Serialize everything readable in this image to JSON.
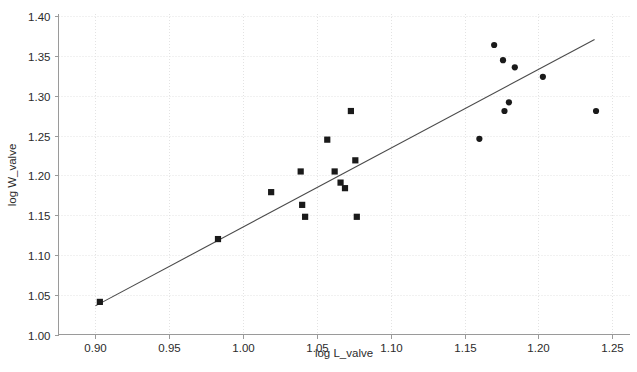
{
  "chart_data": {
    "type": "scatter",
    "title": "",
    "xlabel": "log L_valve",
    "ylabel": "log W_valve",
    "xlim": [
      0.875,
      1.262
    ],
    "ylim": [
      1.0,
      1.403
    ],
    "grid": true,
    "legend": "none",
    "xticks": [
      "0.90",
      "0.95",
      "1.00",
      "1.05",
      "1.10",
      "1.15",
      "1.20",
      "1.25"
    ],
    "xtick_values": [
      0.9,
      0.95,
      1.0,
      1.05,
      1.1,
      1.15,
      1.2,
      1.25
    ],
    "yticks": [
      "1.00",
      "1.05",
      "1.10",
      "1.15",
      "1.20",
      "1.25",
      "1.30",
      "1.35",
      "1.40"
    ],
    "ytick_values": [
      1.0,
      1.05,
      1.1,
      1.15,
      1.2,
      1.25,
      1.3,
      1.35,
      1.4
    ],
    "series": [
      {
        "name": "group-square",
        "marker": "square",
        "color": "#1a1a1a",
        "points": [
          {
            "x": 0.903,
            "y": 1.041
          },
          {
            "x": 0.983,
            "y": 1.12
          },
          {
            "x": 1.019,
            "y": 1.179
          },
          {
            "x": 1.039,
            "y": 1.205
          },
          {
            "x": 1.04,
            "y": 1.163
          },
          {
            "x": 1.042,
            "y": 1.148
          },
          {
            "x": 1.057,
            "y": 1.245
          },
          {
            "x": 1.062,
            "y": 1.205
          },
          {
            "x": 1.066,
            "y": 1.191
          },
          {
            "x": 1.069,
            "y": 1.184
          },
          {
            "x": 1.073,
            "y": 1.281
          },
          {
            "x": 1.076,
            "y": 1.219
          },
          {
            "x": 1.077,
            "y": 1.148
          }
        ]
      },
      {
        "name": "group-circle",
        "marker": "circle",
        "color": "#1a1a1a",
        "points": [
          {
            "x": 1.16,
            "y": 1.246
          },
          {
            "x": 1.17,
            "y": 1.364
          },
          {
            "x": 1.176,
            "y": 1.345
          },
          {
            "x": 1.177,
            "y": 1.281
          },
          {
            "x": 1.18,
            "y": 1.292
          },
          {
            "x": 1.184,
            "y": 1.336
          },
          {
            "x": 1.203,
            "y": 1.324
          },
          {
            "x": 1.239,
            "y": 1.281
          }
        ]
      }
    ],
    "trend_line": {
      "name": "fitted-regression-line",
      "color": "#4a4a4a",
      "x_start": 0.9,
      "y_start": 1.036,
      "x_end": 1.238,
      "y_end": 1.371
    }
  }
}
